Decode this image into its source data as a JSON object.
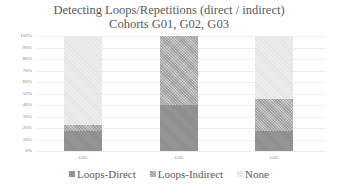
{
  "chart_data": {
    "type": "bar",
    "stacked": true,
    "percent_stacked": true,
    "title": "Detecting Loops/Repetitions (direct / indirect)",
    "subtitle": "Cohorts G01, G02, G03",
    "xlabel": "",
    "ylabel": "",
    "ylim": [
      0,
      100
    ],
    "y_tick_labels": [
      "0%",
      "10%",
      "20%",
      "30%",
      "40%",
      "50%",
      "60%",
      "70%",
      "80%",
      "90%",
      "100%"
    ],
    "grid": true,
    "legend_position": "bottom",
    "categories": [
      "G01",
      "G02",
      "G03"
    ],
    "series": [
      {
        "name": "Loops-Direct",
        "color": "#8c8c8c",
        "values": [
          17,
          40,
          17
        ]
      },
      {
        "name": "Loops-Indirect",
        "color": "#bdbdbd",
        "values": [
          6,
          60,
          28
        ]
      },
      {
        "name": "None",
        "color": "#ececec",
        "values": [
          77,
          0,
          55
        ]
      }
    ]
  }
}
